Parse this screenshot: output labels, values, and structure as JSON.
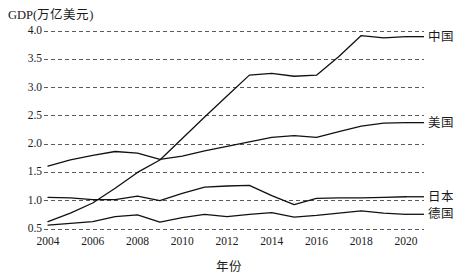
{
  "chart_data": {
    "type": "line",
    "title": "",
    "ylabel": "GDP(万亿美元)",
    "xlabel": "年份",
    "grid": true,
    "legend_position": "right-inline",
    "xlim": [
      2004,
      2020
    ],
    "ylim": [
      0.5,
      4.0
    ],
    "yticks": [
      "4.0",
      "3.5",
      "3.0",
      "2.5",
      "2.0",
      "1.5",
      "1.0",
      "0.5"
    ],
    "ytick_values": [
      4.0,
      3.5,
      3.0,
      2.5,
      2.0,
      1.5,
      1.0,
      0.5
    ],
    "xticks": [
      "2004",
      "2006",
      "2008",
      "2010",
      "2012",
      "2014",
      "2016",
      "2018",
      "2020"
    ],
    "xtick_values": [
      2004,
      2006,
      2008,
      2010,
      2012,
      2014,
      2016,
      2018,
      2020
    ],
    "x": [
      2004,
      2005,
      2006,
      2007,
      2008,
      2009,
      2010,
      2011,
      2012,
      2013,
      2014,
      2015,
      2016,
      2017,
      2018,
      2019,
      2020
    ],
    "series": [
      {
        "name": "中国",
        "label": "中国",
        "values": [
          0.63,
          0.78,
          0.96,
          1.22,
          1.5,
          1.72,
          2.1,
          2.48,
          2.85,
          3.22,
          3.25,
          3.2,
          3.22,
          3.55,
          3.92,
          3.88,
          3.9
        ]
      },
      {
        "name": "美国",
        "label": "美国",
        "values": [
          1.61,
          1.72,
          1.8,
          1.87,
          1.84,
          1.73,
          1.79,
          1.88,
          1.96,
          2.04,
          2.12,
          2.15,
          2.12,
          2.22,
          2.32,
          2.37,
          2.38
        ]
      },
      {
        "name": "日本",
        "label": "日本",
        "values": [
          1.06,
          1.05,
          1.02,
          1.02,
          1.08,
          1.0,
          1.13,
          1.24,
          1.26,
          1.27,
          1.09,
          0.93,
          1.04,
          1.05,
          1.05,
          1.06,
          1.07
        ]
      },
      {
        "name": "德国",
        "label": "德国",
        "values": [
          0.57,
          0.6,
          0.63,
          0.72,
          0.75,
          0.62,
          0.7,
          0.76,
          0.72,
          0.76,
          0.79,
          0.71,
          0.74,
          0.78,
          0.82,
          0.78,
          0.76
        ]
      }
    ]
  }
}
